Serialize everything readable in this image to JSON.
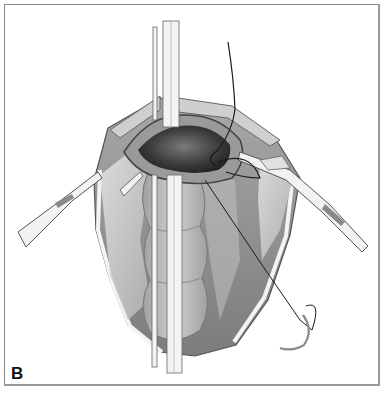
{
  "figure": {
    "panel_label": "B",
    "colors": {
      "frame_border": "#8a8a8a",
      "tissue_dark": "#3a3a3a",
      "tissue_mid": "#8c8c8c",
      "tissue_light": "#d4d4d4",
      "instrument": "#f2f2f2",
      "suture": "#1a1a1a"
    }
  }
}
